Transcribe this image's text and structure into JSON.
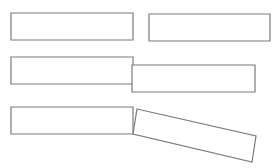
{
  "canvas": {
    "width": 279,
    "height": 168,
    "background": "#ffffff"
  },
  "style": {
    "stroke": "#7a7a7a",
    "stroke_width": 1.2,
    "fill": "#ffffff"
  },
  "rows": [
    {
      "name": "row-1-separated",
      "shapes": [
        {
          "name": "rect-1a",
          "points": [
            [
              11,
              13
            ],
            [
              133,
              13
            ],
            [
              133,
              40
            ],
            [
              11,
              40
            ]
          ]
        },
        {
          "name": "rect-1b",
          "points": [
            [
              149,
              14
            ],
            [
              270,
              14
            ],
            [
              270,
              41
            ],
            [
              149,
              41
            ]
          ]
        }
      ]
    },
    {
      "name": "row-2-offset",
      "shapes": [
        {
          "name": "rect-2a",
          "points": [
            [
              11,
              57
            ],
            [
              133,
              57
            ],
            [
              133,
              84
            ],
            [
              11,
              84
            ]
          ]
        },
        {
          "name": "rect-2b",
          "points": [
            [
              132,
              65
            ],
            [
              255,
              65
            ],
            [
              255,
              92
            ],
            [
              132,
              92
            ]
          ]
        }
      ]
    },
    {
      "name": "row-3-rotated",
      "shapes": [
        {
          "name": "rect-3a",
          "points": [
            [
              11,
              107
            ],
            [
              133,
              107
            ],
            [
              133,
              134
            ],
            [
              11,
              134
            ]
          ]
        },
        {
          "name": "rect-3b",
          "points": [
            [
              137,
              109
            ],
            [
              256,
              136
            ],
            [
              252,
              162
            ],
            [
              133,
              134
            ]
          ]
        }
      ]
    }
  ]
}
